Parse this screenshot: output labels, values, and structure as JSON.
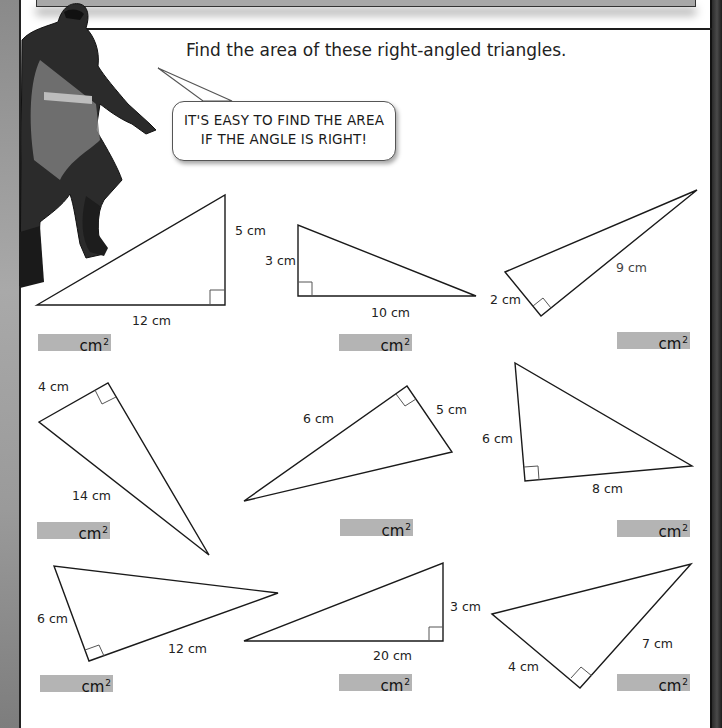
{
  "worksheet": {
    "instruction": "Find the area of these right-angled triangles.",
    "speech_bubble": {
      "line1": "IT'S EASY TO FIND THE AREA",
      "line2": "IF THE ANGLE IS RIGHT!"
    },
    "answer_unit": "cm",
    "answer_unit_power": "2",
    "colors": {
      "answer_box": "#b4b4b4",
      "line": "#1a1a1a",
      "page": "#ffffff"
    },
    "triangles": [
      {
        "id": 1,
        "labels": [
          "5 cm",
          "12 cm"
        ],
        "points": "37,305 225,195 225,305",
        "right_angle_at": "225,305"
      },
      {
        "id": 2,
        "labels": [
          "3 cm",
          "10 cm"
        ],
        "points": "298,225 298,296 476,296",
        "right_angle_at": "298,296"
      },
      {
        "id": 3,
        "labels": [
          "9 cm",
          "2 cm"
        ],
        "points": "505,272 697,190 541,316",
        "right_angle_at": "541,316"
      },
      {
        "id": 4,
        "labels": [
          "4 cm",
          "14 cm"
        ],
        "points": "39,422 108,383 209,555",
        "right_angle_at": "108,383"
      },
      {
        "id": 5,
        "labels": [
          "6 cm",
          "5 cm"
        ],
        "points": "244,501 407,386 452,452",
        "right_angle_at": "407,386"
      },
      {
        "id": 6,
        "labels": [
          "6 cm",
          "8 cm"
        ],
        "points": "515,363 525,481 692,466",
        "right_angle_at": "525,481"
      },
      {
        "id": 7,
        "labels": [
          "6 cm",
          "12 cm"
        ],
        "points": "54,566 89,661 278,593",
        "right_angle_at": "89,661"
      },
      {
        "id": 8,
        "labels": [
          "3 cm",
          "20 cm"
        ],
        "points": "244,641 443,563 443,641",
        "right_angle_at": "443,641"
      },
      {
        "id": 9,
        "labels": [
          "4 cm",
          "7 cm"
        ],
        "points": "492,614 691,564 580,688",
        "right_angle_at": "580,688"
      }
    ]
  }
}
